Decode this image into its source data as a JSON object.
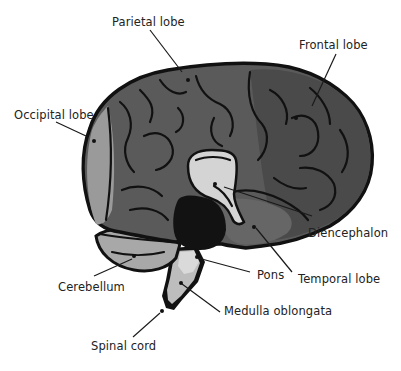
{
  "colors": {
    "background": "#ffffff",
    "outline": "#111111",
    "cerebrum": "#5a5a5a",
    "frontal": "#4e4e4e",
    "occipital": "#9a9a9a",
    "cerebellum": "#a8a8a8",
    "diencephalon": "#d4d4d4",
    "midbrain": "#121212",
    "pons": "#d9d9d9",
    "brainstem": "#bdbdbd",
    "label_text": "#222222"
  },
  "labels": [
    {
      "id": "parietal",
      "text": "Parietal lobe"
    },
    {
      "id": "frontal",
      "text": "Frontal lobe"
    },
    {
      "id": "occipital",
      "text": "Occipital lobe"
    },
    {
      "id": "diencephalon",
      "text": "Diencephalon"
    },
    {
      "id": "pons",
      "text": "Pons"
    },
    {
      "id": "temporal",
      "text": "Temporal lobe"
    },
    {
      "id": "cerebellum",
      "text": "Cerebellum"
    },
    {
      "id": "medulla",
      "text": "Medulla oblongata"
    },
    {
      "id": "spinal",
      "text": "Spinal cord"
    }
  ]
}
